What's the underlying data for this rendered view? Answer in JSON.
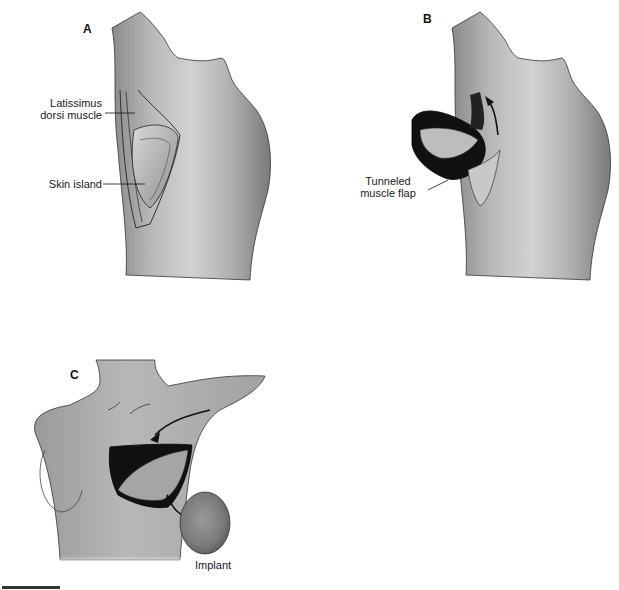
{
  "figure": {
    "panels": [
      {
        "id": "A",
        "letter": "A",
        "view": "back",
        "labels": [
          {
            "text_line1": "Latissimus",
            "text_line2": "dorsi muscle"
          },
          {
            "text": "Skin island"
          }
        ]
      },
      {
        "id": "B",
        "letter": "B",
        "view": "back",
        "labels": [
          {
            "text_line1": "Tunneled",
            "text_line2": "muscle flap"
          }
        ]
      },
      {
        "id": "C",
        "letter": "C",
        "view": "front",
        "labels": [
          {
            "text": "Implant"
          }
        ]
      }
    ]
  },
  "colors": {
    "skin_light": "#d9d9d9",
    "skin_mid": "#a8a8a8",
    "skin_dark": "#6e6e6e",
    "flap_dark": "#111111",
    "outline": "#222222",
    "background": "#ffffff"
  }
}
